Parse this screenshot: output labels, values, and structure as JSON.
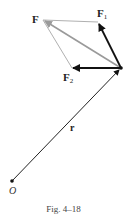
{
  "figure": {
    "caption": "Fig. 4–18",
    "labels": {
      "F": "F",
      "F1_main": "F",
      "F1_sub": "1",
      "F2_main": "F",
      "F2_sub": "2",
      "r": "r",
      "O": "O"
    },
    "points": {
      "O": [
        12,
        181
      ],
      "P": [
        121,
        68
      ],
      "F_tip": [
        43,
        20
      ],
      "F1_tip": [
        98,
        22
      ],
      "F2_tip": [
        72,
        68
      ]
    },
    "colors": {
      "dark_vector": "#111111",
      "resultant": "#9a9a9a",
      "construction": "#b0b0b0"
    }
  }
}
